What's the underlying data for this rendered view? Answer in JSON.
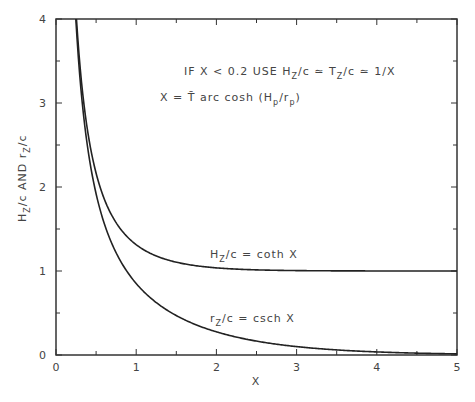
{
  "chart_data": {
    "type": "line",
    "title": "",
    "xlabel": "X",
    "ylabel": "H_z/c AND r_z/c",
    "xlim": [
      0,
      5
    ],
    "ylim": [
      0,
      4
    ],
    "grid": false,
    "x_ticks": [
      "0",
      "1",
      "2",
      "3",
      "4",
      "5"
    ],
    "y_ticks": [
      "0",
      "1",
      "2",
      "3",
      "4"
    ],
    "series": [
      {
        "name": "H_z/c = coth X",
        "x": [
          0.255,
          0.3,
          0.4,
          0.5,
          0.6,
          0.8,
          1.0,
          1.25,
          1.5,
          2.0,
          2.5,
          3.0,
          4.0,
          5.0
        ],
        "values": [
          4.0,
          3.43,
          2.63,
          2.16,
          1.86,
          1.51,
          1.31,
          1.18,
          1.1,
          1.04,
          1.01,
          1.005,
          1.001,
          1.0
        ]
      },
      {
        "name": "r_z/c = csch X",
        "x": [
          0.247,
          0.3,
          0.4,
          0.5,
          0.6,
          0.8,
          1.0,
          1.25,
          1.5,
          2.0,
          2.5,
          3.0,
          4.0,
          5.0
        ],
        "values": [
          4.0,
          3.28,
          2.43,
          1.92,
          1.57,
          1.13,
          0.85,
          0.62,
          0.47,
          0.28,
          0.16,
          0.1,
          0.04,
          0.01
        ]
      }
    ],
    "annotations": {
      "line1": {
        "pre": "IF X < 0.2 USE H",
        "sub1": "Z",
        "mid1": "/c ≃ T",
        "sub2": "Z",
        "post": "/c ≃ 1/X"
      },
      "line2": {
        "pre": "X = T̄ arc cosh (H",
        "sub1": "p",
        "mid1": "/r",
        "sub2": "p",
        "post": ")"
      },
      "coth_label": {
        "pre": "H",
        "sub": "Z",
        "post": "/c = coth X"
      },
      "csch_label": {
        "pre": "r",
        "sub": "Z",
        "post": "/c = csch X"
      },
      "ylabel_parts": {
        "a": "H",
        "a_sub": "Z",
        "b": "/c AND r",
        "b_sub": "Z",
        "c": "/c"
      }
    }
  }
}
